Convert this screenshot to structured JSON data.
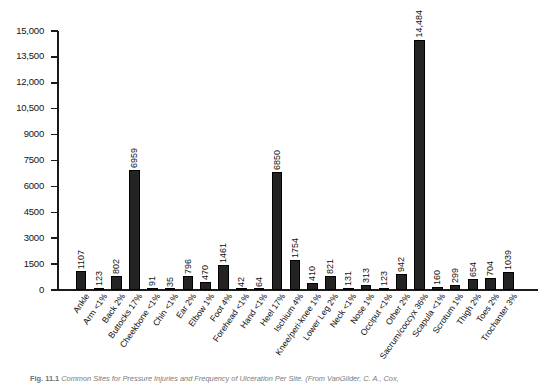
{
  "figure": {
    "caption_label": "Fig. 11.1",
    "caption_text": "Common Sites for Pressure Injuries and Frequency of Ulceration Per Site. (From VanGilder, C. A., Cox,"
  },
  "chart_data": {
    "type": "bar",
    "title": "",
    "xlabel": "",
    "ylabel": "",
    "ylim": [
      0,
      15000
    ],
    "grid": false,
    "legend": "none",
    "y_ticks": [
      0,
      1500,
      3000,
      4500,
      6000,
      7500,
      9000,
      10500,
      12000,
      13500,
      15000
    ],
    "y_tick_labels": [
      "0",
      "1500",
      "3000",
      "4500",
      "6000",
      "7500",
      "9000",
      "10,500",
      "12,000",
      "13,500",
      "15,000"
    ],
    "bar_color": "#232323",
    "categories": [
      "Ankle",
      "Arm <1%",
      "Back 2%",
      "Buttocks 17%",
      "Cheekbone <1%",
      "Chin <1%",
      "Ear 2%",
      "Elbow 1%",
      "Foot 4%",
      "Forehead <1%",
      "Hand <1%",
      "Heel 17%",
      "Ischium 4%",
      "Knee/peri-knee 1%",
      "Lower Leg 2%",
      "Neck <1%",
      "Nose 1%",
      "Occiput <1%",
      "Other 2%",
      "Sacrum/coccyx 36%",
      "Scapula <1%",
      "Scrotum 1%",
      "Thigh 2%",
      "Toes 2%",
      "Trochanter 3%"
    ],
    "values": [
      1107,
      123,
      802,
      6959,
      91,
      35,
      796,
      470,
      1461,
      42,
      64,
      6850,
      1754,
      410,
      821,
      131,
      313,
      123,
      942,
      14484,
      160,
      299,
      654,
      704,
      1039
    ],
    "value_labels": [
      "1107",
      "123",
      "802",
      "6959",
      "91",
      "35",
      "796",
      "470",
      "1461",
      "42",
      "64",
      "6850",
      "1754",
      "410",
      "821",
      "131",
      "313",
      "123",
      "942",
      "14,484",
      "160",
      "299",
      "654",
      "704",
      "1039"
    ]
  }
}
